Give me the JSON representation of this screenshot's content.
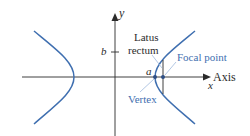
{
  "figure": {
    "type": "hyperbola-diagram",
    "colors": {
      "curve": "#3f6fb0",
      "axes": "#2b2b2b",
      "label_blue": "#3f6fb0",
      "label_black": "#2b2b2b",
      "leader_line": "#a9c1e0"
    },
    "axes": {
      "x_axis_label": "Axis",
      "x_variable": "x",
      "y_variable": "y"
    },
    "ticks": {
      "b_label": "b",
      "a_label": "a"
    },
    "annotations": {
      "latus_rectum_line1": "Latus",
      "latus_rectum_line2": "rectum",
      "focal_point": "Focal point",
      "vertex": "Vertex"
    }
  }
}
